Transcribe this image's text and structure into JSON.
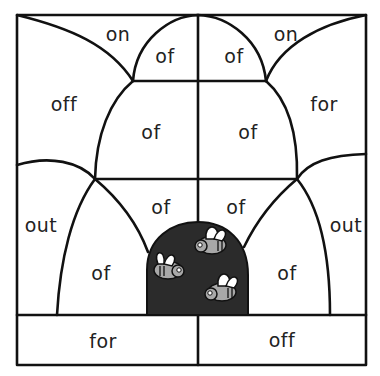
{
  "puzzle": {
    "type": "color-by-word worksheet",
    "colors": {
      "line": "#111111",
      "hive": "#2b2b2b",
      "bee_body": "#a8a8a8",
      "bee_wing": "#ffffff",
      "background": "#ffffff"
    },
    "regions": [
      {
        "id": "top-left-on",
        "word": "on",
        "x": 118,
        "y": 34
      },
      {
        "id": "top-dome-left-of",
        "word": "of",
        "x": 165,
        "y": 56
      },
      {
        "id": "top-dome-right-of",
        "word": "of",
        "x": 234,
        "y": 56
      },
      {
        "id": "top-right-on",
        "word": "on",
        "x": 286,
        "y": 34
      },
      {
        "id": "left-off",
        "word": "off",
        "x": 64,
        "y": 104
      },
      {
        "id": "middle-left-of",
        "word": "of",
        "x": 151,
        "y": 132
      },
      {
        "id": "middle-right-of",
        "word": "of",
        "x": 248,
        "y": 132
      },
      {
        "id": "right-for",
        "word": "for",
        "x": 324,
        "y": 104
      },
      {
        "id": "lower-center-left-of",
        "word": "of",
        "x": 161,
        "y": 207
      },
      {
        "id": "lower-center-right-of",
        "word": "of",
        "x": 236,
        "y": 207
      },
      {
        "id": "left-out",
        "word": "out",
        "x": 41,
        "y": 225
      },
      {
        "id": "right-out",
        "word": "out",
        "x": 346,
        "y": 225
      },
      {
        "id": "lower-left-of",
        "word": "of",
        "x": 101,
        "y": 273
      },
      {
        "id": "lower-right-of",
        "word": "of",
        "x": 287,
        "y": 273
      },
      {
        "id": "bottom-left-for",
        "word": "for",
        "x": 103,
        "y": 341
      },
      {
        "id": "bottom-right-off",
        "word": "off",
        "x": 282,
        "y": 340
      }
    ]
  }
}
